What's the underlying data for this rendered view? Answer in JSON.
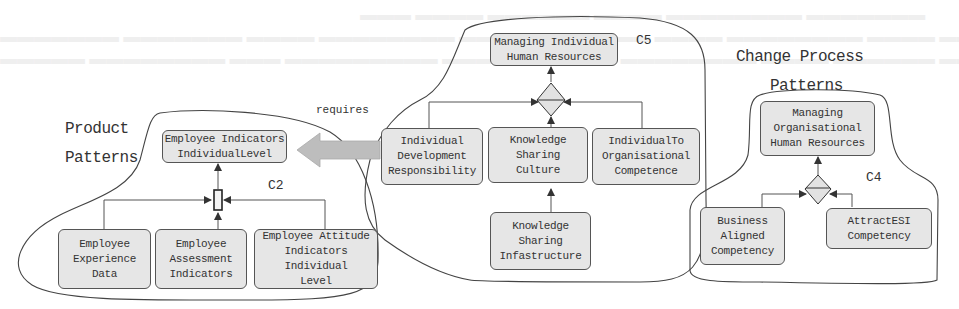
{
  "diagram": {
    "groups": [
      {
        "id": "product-patterns",
        "title_lines": [
          "Product",
          "Patterns"
        ],
        "cluster_label": "C2",
        "target": "Employee Indicators IndividualLevel",
        "sources": [
          "Employee Experience Data",
          "Employee Assessment Indicators",
          "Employee Attitude Indicators Individual Level"
        ]
      },
      {
        "id": "c5-cluster",
        "cluster_label": "C5",
        "target": "Managing Individual Human Resources",
        "sources": [
          "Individual Development Responsibility",
          "Knowledge Sharing Culture",
          "IndividualTo Organisational Competence"
        ],
        "sub_source": "Knowledge Sharing Infastructure"
      },
      {
        "id": "change-process-patterns",
        "title_lines": [
          "Change Process",
          "Patterns"
        ],
        "cluster_label": "C4",
        "target": "Managing Organisational Human Resources",
        "sources": [
          "Business Aligned Competency",
          "AttractESI Competency"
        ]
      }
    ],
    "relation": {
      "label": "requires",
      "from": "c5-cluster",
      "to": "Employee Indicators IndividualLevel"
    },
    "colors": {
      "box_fill": "#e6e6e6",
      "box_border": "#555555",
      "line": "#555555",
      "arrow_fill": "#bdbdbd",
      "background": "#ffffff"
    }
  },
  "nodes": {
    "emp_ind": [
      "Employee Indicators",
      "IndividualLevel"
    ],
    "emp_exp": [
      "Employee",
      "Experience",
      "Data"
    ],
    "emp_assess": [
      "Employee",
      "Assessment",
      "Indicators"
    ],
    "emp_att": [
      "Employee Attitude",
      "Indicators Individual",
      "Level"
    ],
    "mng_ind": [
      "Managing Individual",
      "Human Resources"
    ],
    "ind_dev": [
      "Individual",
      "Development",
      "Responsibility"
    ],
    "ks_culture": [
      "Knowledge",
      "Sharing",
      "Culture"
    ],
    "ind_org": [
      "IndividualTo",
      "Organisational",
      "Competence"
    ],
    "ks_infra": [
      "Knowledge",
      "Sharing",
      "Infastructure"
    ],
    "mng_org": [
      "Managing",
      "Organisational",
      "Human Resources"
    ],
    "bus_align": [
      "Business",
      "Aligned",
      "Competency"
    ],
    "attract": [
      "AttractESI",
      "Competency"
    ]
  },
  "labels": {
    "product_1": "Product",
    "product_2": "Patterns",
    "change_1": "Change Process",
    "change_2": "Patterns",
    "c2": "C2",
    "c5": "C5",
    "c4": "C4",
    "requires": "requires"
  }
}
